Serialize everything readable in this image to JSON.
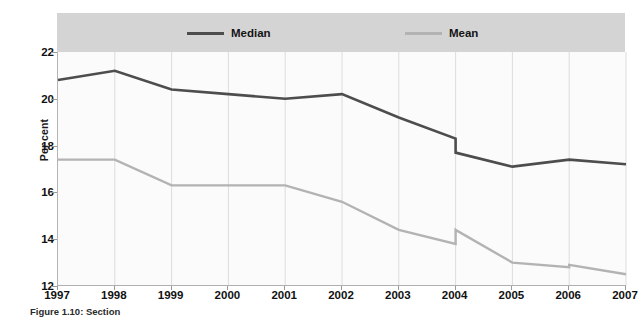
{
  "figure": {
    "caption": "Figure 1.10: Section"
  },
  "chart_data": {
    "type": "line",
    "title": "",
    "subtitle": "",
    "xlabel": "",
    "ylabel": "Per cent",
    "categories": [
      "1997",
      "1998",
      "1999",
      "2000",
      "2001",
      "2002",
      "2003",
      "2004",
      "2005",
      "2006",
      "2007"
    ],
    "x": [
      1997,
      1998,
      1999,
      2000,
      2001,
      2002,
      2003,
      2004,
      2005,
      2006,
      2007
    ],
    "xlim": [
      1997,
      2007
    ],
    "ylim": [
      12,
      22
    ],
    "y_ticks": [
      12,
      14,
      16,
      18,
      20,
      22
    ],
    "x_ticks": [
      1997,
      1998,
      1999,
      2000,
      2001,
      2002,
      2003,
      2004,
      2005,
      2006,
      2007
    ],
    "grid": "vertical",
    "legend_position": "top",
    "series": [
      {
        "name": "Median",
        "color": "#4d4d4d",
        "values": [
          20.8,
          21.2,
          20.4,
          20.2,
          20.0,
          20.2,
          19.2,
          18.3,
          17.1,
          17.4,
          17.2
        ],
        "break_at": 2004,
        "values_after_break": {
          "2004": 17.7
        }
      },
      {
        "name": "Mean",
        "color": "#b3b3b3",
        "values": [
          17.4,
          17.4,
          16.3,
          16.3,
          16.3,
          15.6,
          14.4,
          13.8,
          13.0,
          12.8,
          12.5
        ],
        "break_at": 2004,
        "values_after_break": {
          "2004": 14.4,
          "2006": 12.9
        }
      }
    ],
    "annotations": [
      "Series contain a discontinuity (vertical step) at 2004 for both Median and Mean",
      "Mean series has a small step at 2006"
    ]
  },
  "legend": {
    "entries": [
      {
        "label": "Median",
        "color": "#4d4d4d"
      },
      {
        "label": "Mean",
        "color": "#b3b3b3"
      }
    ]
  },
  "axis": {
    "y_labels": [
      "22",
      "20",
      "18",
      "16",
      "14",
      "12"
    ],
    "x_labels": [
      "1997",
      "1998",
      "1999",
      "2000",
      "2001",
      "2002",
      "2003",
      "2004",
      "2005",
      "2006",
      "2007"
    ],
    "y_title": "Per cent"
  },
  "colors": {
    "median_line": "#4d4d4d",
    "mean_line": "#b3b3b3",
    "legend_band": "#d4d4d4",
    "plot_background": "#fbfbfb",
    "gridline": "#dcdcdc",
    "axis": "#b0b0b0"
  }
}
